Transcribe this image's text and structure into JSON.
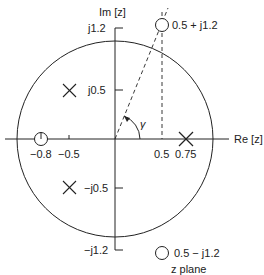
{
  "axes": {
    "im_label": "Im [z]",
    "re_label": "Re [z]",
    "re_ticks": [
      "−0.8",
      "−0.5",
      "0.5",
      "0.75"
    ],
    "im_ticks": [
      "j1.2",
      "j0.5",
      "−j0.5",
      "−j1.2"
    ]
  },
  "angle_label": "γ",
  "zeros": [
    {
      "label": "0.5 + j1.2",
      "re": 0.5,
      "im": 1.2
    },
    {
      "label": "0.5 − j1.2",
      "re": 0.5,
      "im": -1.2
    },
    {
      "label": "",
      "re": -0.8,
      "im": 0
    }
  ],
  "poles": [
    {
      "re": -0.5,
      "im": 0.5
    },
    {
      "re": -0.5,
      "im": -0.5
    },
    {
      "re": 0.75,
      "im": 0
    }
  ],
  "caption": "z plane",
  "unit_circle": true
}
